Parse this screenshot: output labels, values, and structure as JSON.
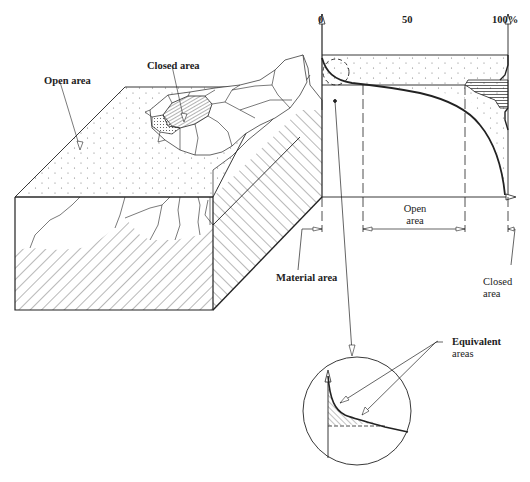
{
  "figure": {
    "labels": {
      "open_area": "Open area",
      "closed_area_top": "Closed area",
      "axis_0": "0",
      "axis_50": "50",
      "axis_100": "100%",
      "open_area_dim_1": "Open",
      "open_area_dim_2": "area",
      "material_area": "Material area",
      "closed_area_dim_1": "Closed",
      "closed_area_dim_2": "area",
      "equivalent_1": "Equivalent",
      "equivalent_2": "areas"
    },
    "colors": {
      "ink": "#222222",
      "background": "#ffffff"
    },
    "axis": {
      "ticks": [
        "0",
        "50",
        "100%"
      ]
    }
  }
}
